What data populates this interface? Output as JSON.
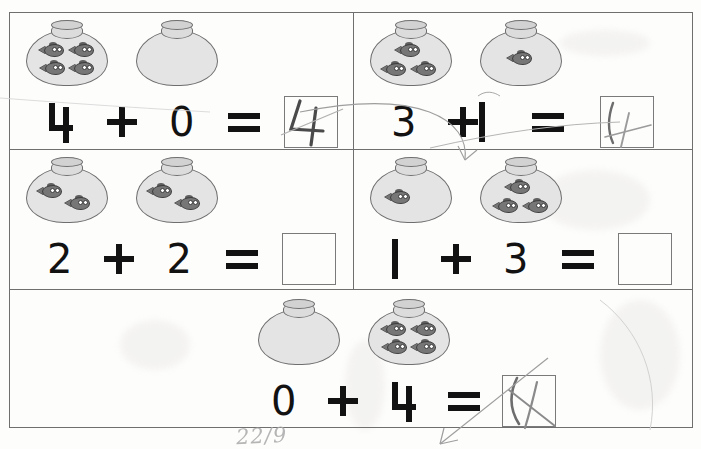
{
  "worksheet": {
    "title": "Fishbowl Addition Worksheet",
    "ink_color": "#121212",
    "grid_color": "#6f6f6f",
    "bowl_fill": "#e4e4e4",
    "fish_color": "#767676",
    "pencil_color": "#8c8c8c",
    "date_mark": "22/9"
  },
  "problems": [
    {
      "id": "problem-1",
      "row": 1,
      "column": 1,
      "left_bowl_fish": 4,
      "right_bowl_fish": 0,
      "addend_left": "4",
      "operator": "+",
      "addend_right": "0",
      "equals": "=",
      "answer": "4",
      "answer_filled": true,
      "answer_handwritten": true
    },
    {
      "id": "problem-2",
      "row": 1,
      "column": 2,
      "left_bowl_fish": 3,
      "right_bowl_fish": 1,
      "addend_left": "3",
      "operator": "+",
      "addend_right": "1",
      "equals": "=",
      "answer": "4",
      "answer_filled": true,
      "answer_handwritten": true
    },
    {
      "id": "problem-3",
      "row": 2,
      "column": 1,
      "left_bowl_fish": 2,
      "right_bowl_fish": 2,
      "addend_left": "2",
      "operator": "+",
      "addend_right": "2",
      "equals": "=",
      "answer": "",
      "answer_filled": false,
      "answer_handwritten": false
    },
    {
      "id": "problem-4",
      "row": 2,
      "column": 2,
      "left_bowl_fish": 1,
      "right_bowl_fish": 3,
      "addend_left": "1",
      "operator": "+",
      "addend_right": "3",
      "equals": "=",
      "answer": "",
      "answer_filled": false,
      "answer_handwritten": false
    },
    {
      "id": "problem-5",
      "row": 3,
      "column": 1,
      "left_bowl_fish": 0,
      "right_bowl_fish": 4,
      "addend_left": "0",
      "operator": "+",
      "addend_right": "4",
      "equals": "=",
      "answer": "4",
      "answer_filled": true,
      "answer_handwritten": true
    }
  ]
}
